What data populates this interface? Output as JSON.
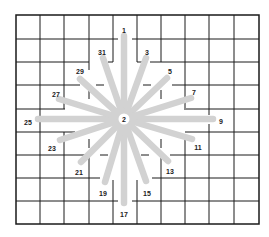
{
  "diagram": {
    "type": "radial-star-on-grid",
    "grid": {
      "columns": 10,
      "rows": 9,
      "x_lines": [
        16,
        40,
        64,
        89,
        113,
        137,
        161,
        185,
        209,
        234,
        259
      ],
      "y_lines": [
        15,
        39,
        62,
        85,
        109,
        132,
        155,
        178,
        201,
        224
      ],
      "line_color": "#1a1a1a"
    },
    "center": {
      "x": 124,
      "y": 119,
      "label": "2"
    },
    "ray_color": "#d2d2d2",
    "rays": [
      {
        "label": "1",
        "end": [
          124,
          36
        ],
        "label_pos": [
          124,
          30
        ]
      },
      {
        "label": "3",
        "end": [
          146,
          58
        ],
        "label_pos": [
          147,
          52
        ]
      },
      {
        "label": "5",
        "end": [
          167,
          78
        ],
        "label_pos": [
          170,
          71
        ]
      },
      {
        "label": "7",
        "end": [
          191,
          98
        ],
        "label_pos": [
          194,
          92
        ]
      },
      {
        "label": "9",
        "end": [
          213,
          119
        ],
        "label_pos": [
          221,
          121
        ]
      },
      {
        "label": "11",
        "end": [
          192,
          139
        ],
        "label_pos": [
          198,
          147
        ]
      },
      {
        "label": "13",
        "end": [
          168,
          161
        ],
        "label_pos": [
          170,
          171
        ]
      },
      {
        "label": "15",
        "end": [
          146,
          181
        ],
        "label_pos": [
          147,
          193
        ]
      },
      {
        "label": "17",
        "end": [
          124,
          203
        ],
        "label_pos": [
          124,
          214
        ]
      },
      {
        "label": "19",
        "end": [
          105,
          182
        ],
        "label_pos": [
          103,
          193
        ]
      },
      {
        "label": "21",
        "end": [
          81,
          162
        ],
        "label_pos": [
          79,
          172
        ]
      },
      {
        "label": "23",
        "end": [
          60,
          140
        ],
        "label_pos": [
          52,
          148
        ]
      },
      {
        "label": "25",
        "end": [
          38,
          119
        ],
        "label_pos": [
          28,
          122
        ]
      },
      {
        "label": "27",
        "end": [
          59,
          99
        ],
        "label_pos": [
          56,
          94
        ]
      },
      {
        "label": "29",
        "end": [
          80,
          79
        ],
        "label_pos": [
          80,
          71
        ]
      },
      {
        "label": "31",
        "end": [
          103,
          58
        ],
        "label_pos": [
          102,
          52
        ]
      }
    ]
  }
}
